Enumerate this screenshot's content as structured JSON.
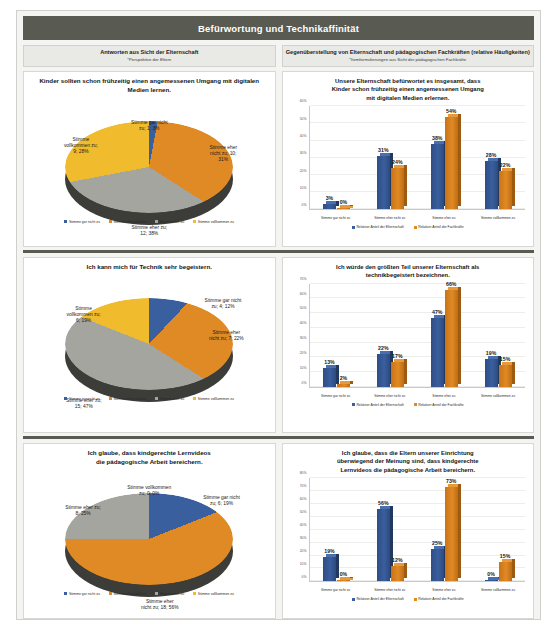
{
  "poster": {
    "main_title": "Befürwortung und Technikaffinität",
    "column_headers": [
      {
        "title": "Antworten aus Sicht der Elternschaft",
        "subtitle": "*Perspektive der Eltern"
      },
      {
        "title": "Gegenüberstellung von Elternschaft und pädagogischen Fachkräften (relative Häufigkeiten)",
        "subtitle": "*Itemformulierungen aus Sicht der pädagogischen Fachkräfte"
      }
    ],
    "legend_labels": {
      "cat1": "Stimme gar nicht zu",
      "cat2": "Stimme eher nicht zu",
      "cat3": "Stimme eher zu",
      "cat4": "Stimme vollkommen zu",
      "series_parents": "Relativer Anteil der Elternschaft",
      "series_staff": "Relativer Anteil der Fachkräfte"
    },
    "colors": {
      "header_bar": "#595a52",
      "blue": "#3a5f9e",
      "orange": "#e08a26",
      "grey": "#a5a5a0",
      "yellow": "#f0bc2e"
    }
  },
  "chart_data": [
    {
      "type": "pie",
      "id": "pie-1",
      "title": "Kinder sollten schon frühzeitig einen angemessenen Umgang mit digitalen Medien lernen.",
      "categories": [
        "Stimme gar nicht zu",
        "Stimme eher nicht zu",
        "Stimme eher zu",
        "Stimme vollkommen zu"
      ],
      "counts": [
        1,
        10,
        12,
        9
      ],
      "values": [
        3,
        31,
        38,
        28
      ],
      "labels": [
        "Stimme gar nicht\nzu; 1; 3%",
        "Stimme eher\nnicht zu; 10;\n31%",
        "Stimme eher zu;\n12; 38%",
        "Stimme\nvollkommen zu;\n9; 28%"
      ],
      "label_lines": [
        [
          "Stimme gar nicht",
          "zu; 1; 3%"
        ],
        [
          "Stimme eher",
          "nicht zu; 10;",
          "31%"
        ],
        [
          "Stimme eher zu;",
          "12; 38%"
        ],
        [
          "Stimme",
          "vollkommen zu;",
          "9; 28%"
        ]
      ],
      "slice_colors": [
        "#3a5f9e",
        "#e08a26",
        "#a5a5a0",
        "#f0bc2e"
      ]
    },
    {
      "type": "bar",
      "id": "bar-1",
      "title": "Unsere Elternschaft befürwortet es insgesamt, dass Kinder schon frühzeitig einen angemessenen Umgang mit digitalen Medien erlernen.",
      "title_lines": [
        "Unsere Elternschaft befürwortet es insgesamt, dass",
        "Kinder schon frühzeitig einen angemessenen Umgang",
        "mit digitalen Medien erlernen."
      ],
      "categories": [
        "Stimme gar nicht zu",
        "Stimme eher nicht zu",
        "Stimme eher zu",
        "Stimme vollkommen zu"
      ],
      "series": [
        {
          "name": "Relativer Anteil der Elternschaft",
          "values": [
            3,
            31,
            38,
            28
          ],
          "labels": [
            "3%",
            "31%",
            "38%",
            "28%"
          ],
          "color": "#3a5f9e"
        },
        {
          "name": "Relativer Anteil der Fachkräfte",
          "values": [
            0,
            24,
            54,
            22
          ],
          "labels": [
            "0%",
            "24%",
            "54%",
            "22%"
          ],
          "color": "#e08a26"
        }
      ],
      "ylim": [
        0,
        60
      ],
      "yticks": [
        "0%",
        "10%",
        "20%",
        "30%",
        "40%",
        "50%",
        "60%"
      ],
      "grid": true,
      "legend_position": "bottom"
    },
    {
      "type": "pie",
      "id": "pie-2",
      "title": "Ich kann mich für Technik sehr begeistern.",
      "categories": [
        "Stimme gar nicht zu",
        "Stimme eher nicht zu",
        "Stimme eher zu",
        "Stimme vollkommen zu"
      ],
      "counts": [
        4,
        7,
        15,
        6
      ],
      "values": [
        12,
        22,
        47,
        19
      ],
      "label_lines": [
        [
          "Stimme gar nicht",
          "zu; 4; 12%"
        ],
        [
          "Stimme eher",
          "nicht zu; 7; 22%"
        ],
        [
          "Stimme eher zu;",
          "15; 47%"
        ],
        [
          "Stimme",
          "vollkommen zu;",
          "6; 19%"
        ]
      ],
      "slice_colors": [
        "#3a5f9e",
        "#e08a26",
        "#a5a5a0",
        "#f0bc2e"
      ]
    },
    {
      "type": "bar",
      "id": "bar-2",
      "title": "Ich würde den größten Teil unserer Elternschaft als technikbegeistert bezeichnen.",
      "title_lines": [
        "Ich würde den größten Teil unserer Elternschaft als",
        "technikbegeistert bezeichnen."
      ],
      "categories": [
        "Stimme gar nicht zu",
        "Stimme eher nicht zu",
        "Stimme eher zu",
        "Stimme vollkommen zu"
      ],
      "series": [
        {
          "name": "Relativer Anteil der Elternschaft",
          "values": [
            13,
            22,
            47,
            19
          ],
          "labels": [
            "13%",
            "22%",
            "47%",
            "19%"
          ],
          "color": "#3a5f9e"
        },
        {
          "name": "Relativer Anteil der Fachkräfte",
          "values": [
            2,
            17,
            66,
            15
          ],
          "labels": [
            "2%",
            "17%",
            "66%",
            "15%"
          ],
          "color": "#e08a26"
        }
      ],
      "ylim": [
        0,
        70
      ],
      "yticks": [
        "0%",
        "10%",
        "20%",
        "30%",
        "40%",
        "50%",
        "60%",
        "70%"
      ],
      "grid": true,
      "legend_position": "bottom"
    },
    {
      "type": "pie",
      "id": "pie-3",
      "title": "Ich glaube, dass kindgerechte Lernvideos die pädagogische Arbeit bereichern.",
      "title_lines": [
        "Ich glaube, dass kindgerechte Lernvideos",
        "die pädagogische Arbeit bereichern."
      ],
      "categories": [
        "Stimme gar nicht zu",
        "Stimme eher nicht zu",
        "Stimme eher zu",
        "Stimme vollkommen zu"
      ],
      "counts": [
        6,
        18,
        8,
        0
      ],
      "values": [
        19,
        56,
        25,
        0
      ],
      "label_lines": [
        [
          "Stimme gar nicht",
          "zu; 6; 19%"
        ],
        [
          "Stimme eher",
          "nicht zu; 18; 56%"
        ],
        [
          "Stimme eher zu;",
          "8; 25%"
        ],
        [
          "Stimme vollkommen",
          "zu; 0; 0%"
        ]
      ],
      "slice_colors": [
        "#3a5f9e",
        "#e08a26",
        "#a5a5a0",
        "#f0bc2e"
      ]
    },
    {
      "type": "bar",
      "id": "bar-3",
      "title": "Ich glaube, dass die Eltern unserer Einrichtung überwiegend der Meinung sind, dass kindgerechte Lernvideos die pädagogische Arbeit bereichern.",
      "title_lines": [
        "Ich glaube, dass die Eltern unserer Einrichtung",
        "überwiegend der Meinung sind, dass kindgerechte",
        "Lernvideos die pädagogische Arbeit bereichern."
      ],
      "categories": [
        "Stimme gar nicht zu",
        "Stimme eher nicht zu",
        "Stimme eher zu",
        "Stimme vollkommen zu"
      ],
      "series": [
        {
          "name": "Relativer Anteil der Elternschaft",
          "values": [
            19,
            56,
            25,
            0
          ],
          "labels": [
            "19%",
            "56%",
            "25%",
            "0%"
          ],
          "color": "#3a5f9e"
        },
        {
          "name": "Relativer Anteil der Fachkräfte",
          "values": [
            0,
            12,
            73,
            15
          ],
          "labels": [
            "0%",
            "12%",
            "73%",
            "15%"
          ],
          "color": "#e08a26"
        }
      ],
      "ylim": [
        0,
        80
      ],
      "yticks": [
        "0%",
        "10%",
        "20%",
        "30%",
        "40%",
        "50%",
        "60%",
        "70%",
        "80%"
      ],
      "grid": true,
      "legend_position": "bottom"
    }
  ]
}
